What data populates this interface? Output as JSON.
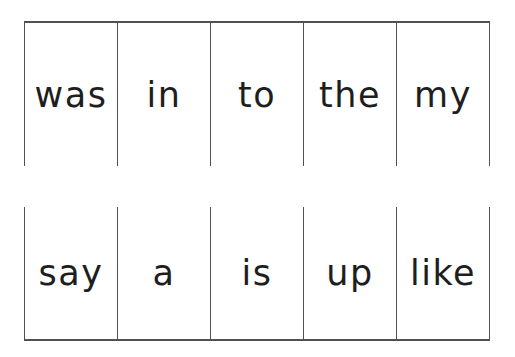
{
  "colors": {
    "background": "#ffffff",
    "grid_line": "#515151",
    "text": "#1e1e1e"
  },
  "flashcards": {
    "rows": [
      {
        "words": [
          "was",
          "in",
          "to",
          "the",
          "my"
        ]
      },
      {
        "words": [
          "say",
          "a",
          "is",
          "up",
          "like"
        ]
      }
    ]
  }
}
